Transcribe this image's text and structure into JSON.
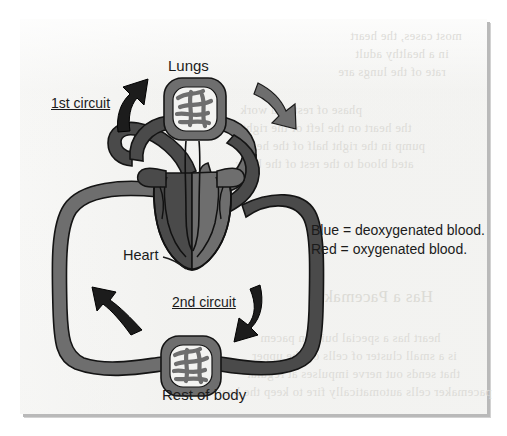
{
  "page": {
    "type": "scanned-textbook-figure",
    "background_color": "#f3f3f1"
  },
  "figure": {
    "title_labels": {
      "lungs": "Lungs",
      "heart": "Heart",
      "rest_of_body": "Rest of body"
    },
    "circuit_labels": {
      "first": "1st circuit",
      "second": "2nd circuit"
    },
    "legend": {
      "line1": "Blue = deoxygenated blood.",
      "line2": "Red = oxygenated blood."
    },
    "colors": {
      "deoxygenated_blue": "#4a4a4a",
      "oxygenated_red": "#6e6e6e",
      "vessel_outline": "#111111",
      "arrow_dark": "#1c1c1c",
      "arrow_light": "#6e6e6e",
      "label_text": "#1b1b1b"
    }
  },
  "ghost_text": {
    "lines": [
      "most cases, the heart",
      "in a healthy adult",
      "rate of the lungs are",
      "phase of rest and work",
      "the heart on the left of the right",
      "pump in the right half of the heart",
      "ated blood to the rest of the body",
      "Has a Pacemaker",
      "heart has a special built-in pacem",
      "is a small cluster of cells on the upper",
      "that sends out nerve impulses at regular",
      "pacemaker cells automatically fire to keep the heart beating"
    ]
  }
}
